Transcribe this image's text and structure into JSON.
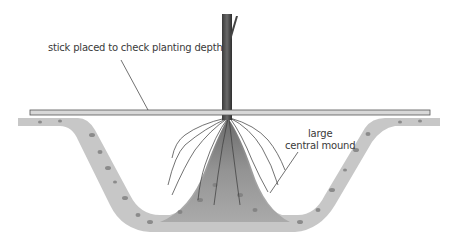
{
  "diagram": {
    "labels": {
      "stick": "stick placed to check planting depth",
      "mound_line1": "large",
      "mound_line2": "central mound"
    },
    "colors": {
      "soil": "#a9a9a9",
      "soil_dark": "#7a7a7a",
      "trunk": "#4a4a4a",
      "stick_fill": "#d8d8d8",
      "stick_edge": "#555555",
      "roots": "#3c3c3c",
      "leader_line": "#333333"
    }
  }
}
